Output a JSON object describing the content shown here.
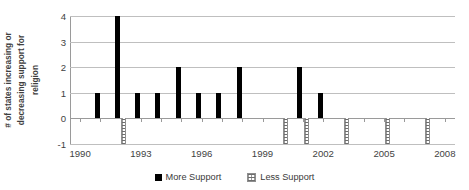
{
  "chart_data": {
    "type": "bar",
    "title": "",
    "xlabel": "",
    "ylabel": "# of states increasing or\ndecreasing support for\nreligion",
    "ylim": [
      -1,
      4
    ],
    "yticks": [
      4,
      3,
      2,
      1,
      0,
      -1
    ],
    "xlim": [
      1989.5,
      2008.5
    ],
    "xticks": [
      1990,
      1993,
      1996,
      1999,
      2002,
      2005,
      2008
    ],
    "xtick_labels": [
      "1990",
      "1993",
      "1996",
      "1999",
      "2002",
      "2005",
      "2008"
    ],
    "grid": "horizontal",
    "legend_position": "bottom",
    "series": [
      {
        "name": "More Support",
        "color": "#000000",
        "pattern": "solid",
        "x": [
          1991,
          1992,
          1993,
          1994,
          1995,
          1996,
          1997,
          1998,
          2001,
          2002
        ],
        "values": [
          1,
          4,
          1,
          1,
          2,
          1,
          1,
          2,
          2,
          1
        ]
      },
      {
        "name": "Less Support",
        "color": "#ffffff",
        "pattern": "dotted-hatch",
        "x": [
          1992,
          2000,
          2001,
          2003,
          2005,
          2007
        ],
        "values": [
          -1,
          -1,
          -1,
          -1,
          -1,
          -1
        ]
      }
    ]
  },
  "legend": {
    "items": [
      {
        "label": "More Support",
        "swatch": "more-support-swatch"
      },
      {
        "label": "Less Support",
        "swatch": "less-support-swatch"
      }
    ]
  },
  "axes": {
    "y_title": "# of states increasing or\ndecreasing support for\nreligion"
  }
}
